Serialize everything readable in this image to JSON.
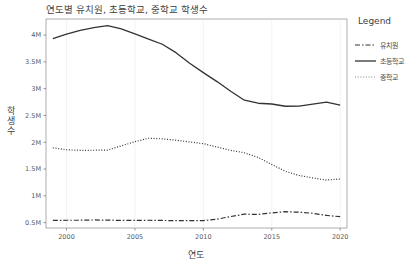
{
  "chart_data": {
    "type": "line",
    "title": "연도별 유치원, 초등학교, 중학교 학생수",
    "xlabel": "연도",
    "ylabel": "학생수",
    "legend_title": "Legend",
    "legend_position": "right",
    "grid": true,
    "xlim": [
      1998.5,
      2020.5
    ],
    "ylim": [
      400000,
      4300000
    ],
    "x_ticks": [
      2000,
      2005,
      2010,
      2015,
      2020
    ],
    "x_tick_labels": [
      "2000",
      "2005",
      "2010",
      "2015",
      "2020"
    ],
    "y_ticks": [
      500000,
      1000000,
      1500000,
      2000000,
      2500000,
      3000000,
      3500000,
      4000000
    ],
    "y_tick_labels": [
      "0.5M",
      "1M",
      "1.5M",
      "2M",
      "2.5M",
      "3M",
      "3.5M",
      "4M"
    ],
    "x": [
      1999,
      2000,
      2001,
      2002,
      2003,
      2004,
      2005,
      2006,
      2007,
      2008,
      2009,
      2010,
      2011,
      2012,
      2013,
      2014,
      2015,
      2016,
      2017,
      2018,
      2019,
      2020
    ],
    "series": [
      {
        "name": "유치원",
        "style": "dashdot",
        "color": "#333333",
        "width": 1.2,
        "values": [
          541000,
          545000,
          545000,
          550000,
          547000,
          542000,
          541000,
          545000,
          541000,
          537000,
          538000,
          538000,
          564000,
          614000,
          658000,
          653000,
          682000,
          704000,
          694000,
          675000,
          634000,
          612000
        ]
      },
      {
        "name": "초등학교",
        "style": "solid",
        "color": "#333333",
        "width": 1.3,
        "values": [
          3935000,
          4019000,
          4089000,
          4138000,
          4175000,
          4116000,
          4022000,
          3925000,
          3829000,
          3672000,
          3474000,
          3299000,
          3132000,
          2951000,
          2784000,
          2728000,
          2714000,
          2672000,
          2674000,
          2711000,
          2747000,
          2693000
        ]
      },
      {
        "name": "중학교",
        "style": "dotted",
        "color": "#888888",
        "width": 1.2,
        "values": [
          1896000,
          1860000,
          1849000,
          1851000,
          1854000,
          1933000,
          2010000,
          2075000,
          2063000,
          2038000,
          2006000,
          1974000,
          1911000,
          1849000,
          1804000,
          1717000,
          1586000,
          1457000,
          1381000,
          1334000,
          1294000,
          1315000
        ]
      }
    ]
  }
}
